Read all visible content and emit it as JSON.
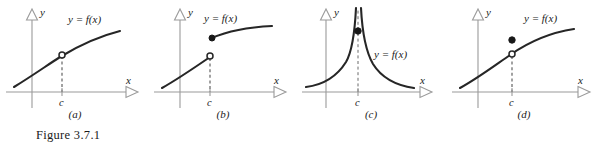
{
  "figure": {
    "caption": "Figure 3.7.1",
    "axis_labels": {
      "x": "x",
      "y": "y"
    },
    "tick_label": "c",
    "curve_label": "y = f(x)"
  },
  "panels": [
    {
      "id": "a",
      "label": "(a)",
      "discontinuity": "removable-hole",
      "description": "Increasing concave-down curve with an open circle (hole) at x = c",
      "markers": {
        "open_circle": true,
        "filled_dot": false
      },
      "curve_label": "y = f(x)",
      "tick_label": "c"
    },
    {
      "id": "b",
      "label": "(b)",
      "discontinuity": "jump",
      "description": "Jump discontinuity: lower branch ends with an open circle at x = c, upper branch starts with a filled dot",
      "markers": {
        "open_circle": true,
        "filled_dot": true
      },
      "curve_label": "y = f(x)",
      "tick_label": "c"
    },
    {
      "id": "c",
      "label": "(c)",
      "discontinuity": "infinite",
      "description": "Infinite discontinuity: both branches rise toward a vertical asymptote at x = c, filled dot marks f(c)",
      "markers": {
        "open_circle": false,
        "filled_dot": true
      },
      "curve_label": "y = f(x)",
      "tick_label": "c"
    },
    {
      "id": "d",
      "label": "(d)",
      "discontinuity": "removable-redefined",
      "description": "Removable discontinuity: open circle on the curve at x = c with a filled dot placed above it",
      "markers": {
        "open_circle": true,
        "filled_dot": true
      },
      "curve_label": "y = f(x)",
      "tick_label": "c"
    }
  ],
  "colors": {
    "curve": "#262626",
    "axis": "#9a9a9a",
    "dashed": "#555555",
    "text": "#1a1a1a",
    "background": "#ffffff"
  }
}
